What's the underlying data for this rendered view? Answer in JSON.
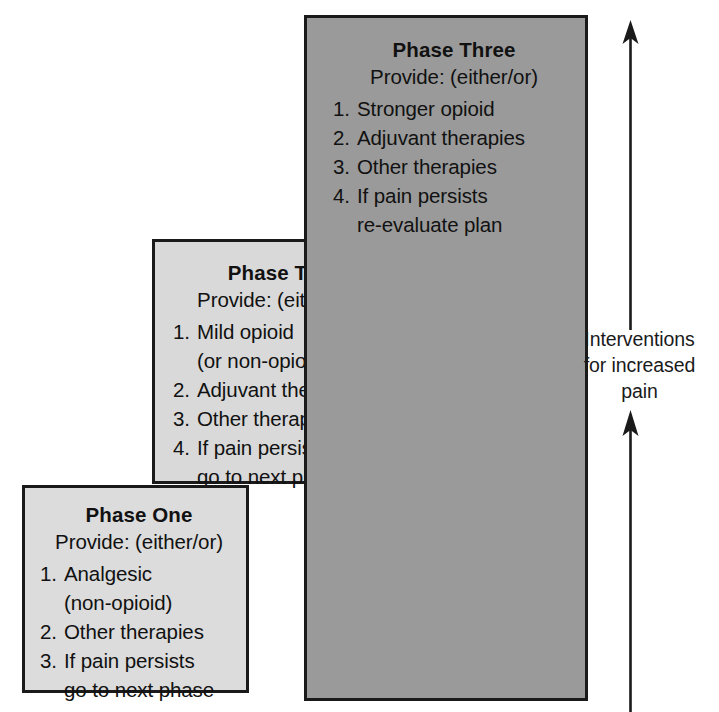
{
  "diagram": {
    "colors": {
      "phase_three_fill": "#9a9a9a",
      "phase_two_fill": "#d9d9d9",
      "phase_one_fill": "#dcdcdc",
      "border": "#1a1a1a",
      "text": "#111111",
      "arrow": "#1a1a1a"
    }
  },
  "phase_three": {
    "title": "Phase Three",
    "provide": "Provide: (either/or)",
    "items": [
      {
        "num": "1.",
        "lines": [
          "Stronger opioid"
        ]
      },
      {
        "num": "2.",
        "lines": [
          "Adjuvant therapies"
        ]
      },
      {
        "num": "3.",
        "lines": [
          "Other therapies"
        ]
      },
      {
        "num": "4.",
        "lines": [
          "If pain persists",
          "re-evaluate plan"
        ]
      }
    ]
  },
  "phase_two": {
    "title": "Phase Two",
    "provide": "Provide: (either/or)",
    "items": [
      {
        "num": "1.",
        "lines": [
          "Mild opioid",
          "(or non-opioid)"
        ]
      },
      {
        "num": "2.",
        "lines": [
          "Adjuvant therapies"
        ]
      },
      {
        "num": "3.",
        "lines": [
          "Other therapies"
        ]
      },
      {
        "num": "4.",
        "lines": [
          "If pain persists",
          "go to next phase"
        ]
      }
    ]
  },
  "phase_one": {
    "title": "Phase One",
    "provide": "Provide: (either/or)",
    "items": [
      {
        "num": "1.",
        "lines": [
          "Analgesic",
          "(non-opioid)"
        ]
      },
      {
        "num": "2.",
        "lines": [
          "Other therapies"
        ]
      },
      {
        "num": "3.",
        "lines": [
          "If pain persists",
          "go to next phase"
        ]
      }
    ]
  },
  "arrow_annotation": {
    "line_1": "Interventions",
    "line_2": "for increased",
    "line_3": "pain",
    "direction": "up"
  }
}
